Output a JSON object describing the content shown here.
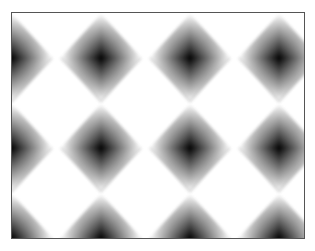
{
  "image": {
    "description": "Grid of soft-edged black diamond shapes on a white background inside a thin gray frame",
    "frame": {
      "left": 11,
      "top": 12,
      "width": 294,
      "height": 227,
      "border_color": "#555555"
    },
    "background_color": "#ffffff",
    "shape_color": "#000000",
    "grid": {
      "columns_x": [
        0,
        89,
        178,
        267
      ],
      "rows_y": [
        45,
        135,
        225
      ],
      "diamond_size": 62
    },
    "diamonds": [
      {
        "x": 0,
        "y": 45
      },
      {
        "x": 89,
        "y": 45
      },
      {
        "x": 178,
        "y": 45
      },
      {
        "x": 267,
        "y": 45
      },
      {
        "x": 0,
        "y": 135
      },
      {
        "x": 89,
        "y": 135
      },
      {
        "x": 178,
        "y": 135
      },
      {
        "x": 267,
        "y": 135
      },
      {
        "x": 0,
        "y": 225
      },
      {
        "x": 89,
        "y": 225
      },
      {
        "x": 178,
        "y": 225
      },
      {
        "x": 267,
        "y": 225
      }
    ]
  }
}
